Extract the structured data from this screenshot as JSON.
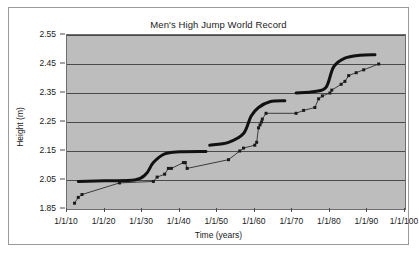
{
  "chart_data": {
    "type": "scatter",
    "title": "Men's High Jump World Record",
    "xlabel": "Time (years)",
    "ylabel": "Height (m)",
    "grid": true,
    "legend": "none",
    "xlim": [
      1910,
      2000
    ],
    "ylim": [
      1.85,
      2.55
    ],
    "x_tick_labels": [
      "1/1/10",
      "1/1/20",
      "1/1/30",
      "1/1/40",
      "1/1/50",
      "1/1/60",
      "1/1/70",
      "1/1/80",
      "1/1/90",
      "1/1/100"
    ],
    "x_tick_values": [
      1910,
      1920,
      1930,
      1940,
      1950,
      1960,
      1970,
      1980,
      1990,
      2000
    ],
    "y_tick_labels": [
      "1.85",
      "2.05",
      "2.15",
      "2.25",
      "2.35",
      "2.45",
      "2.55"
    ],
    "y_tick_values": [
      1.85,
      2.05,
      2.15,
      2.25,
      2.35,
      2.45,
      2.55
    ],
    "series": [
      {
        "name": "World record progression",
        "style": "thin-line-with-square-markers",
        "color": "#1a1a1a",
        "points": [
          [
            1912,
            1.89
          ],
          [
            1913,
            1.93
          ],
          [
            1914,
            1.95
          ],
          [
            1924,
            2.03
          ],
          [
            1933,
            2.04
          ],
          [
            1934,
            2.06
          ],
          [
            1936,
            2.07
          ],
          [
            1937,
            2.09
          ],
          [
            1937.8,
            2.09
          ],
          [
            1941,
            2.11
          ],
          [
            1941.5,
            2.11
          ],
          [
            1942,
            2.09
          ],
          [
            1953,
            2.12
          ],
          [
            1956,
            2.15
          ],
          [
            1957,
            2.16
          ],
          [
            1960,
            2.17
          ],
          [
            1960.5,
            2.18
          ],
          [
            1961,
            2.23
          ],
          [
            1961.4,
            2.24
          ],
          [
            1961.8,
            2.25
          ],
          [
            1962,
            2.26
          ],
          [
            1963,
            2.28
          ],
          [
            1971,
            2.28
          ],
          [
            1973,
            2.29
          ],
          [
            1976,
            2.3
          ],
          [
            1977,
            2.33
          ],
          [
            1978,
            2.34
          ],
          [
            1980,
            2.35
          ],
          [
            1980.5,
            2.36
          ],
          [
            1983,
            2.38
          ],
          [
            1984,
            2.39
          ],
          [
            1985,
            2.41
          ],
          [
            1987,
            2.42
          ],
          [
            1989,
            2.43
          ],
          [
            1993,
            2.45
          ]
        ]
      },
      {
        "name": "Fitted step curve",
        "style": "thick-smooth-curve",
        "color": "#111111",
        "segments": [
          [
            [
              1913,
              2.04
            ],
            [
              1920,
              2.045
            ],
            [
              1928,
              2.05
            ],
            [
              1931,
              2.07
            ],
            [
              1933,
              2.11
            ],
            [
              1936,
              2.14
            ],
            [
              1940,
              2.147
            ],
            [
              1947,
              2.148
            ]
          ],
          [
            [
              1948,
              2.17
            ],
            [
              1953,
              2.18
            ],
            [
              1957,
              2.21
            ],
            [
              1959,
              2.27
            ],
            [
              1961,
              2.3
            ],
            [
              1964,
              2.32
            ],
            [
              1968,
              2.323
            ]
          ],
          [
            [
              1971,
              2.35
            ],
            [
              1976,
              2.355
            ],
            [
              1979,
              2.37
            ],
            [
              1981,
              2.44
            ],
            [
              1984,
              2.47
            ],
            [
              1988,
              2.48
            ],
            [
              1992,
              2.482
            ]
          ]
        ]
      }
    ]
  }
}
